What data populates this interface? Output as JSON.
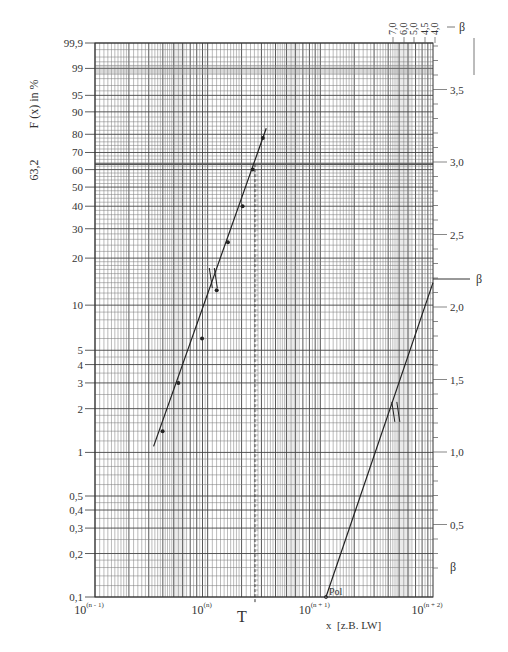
{
  "chart_data": {
    "type": "scatter",
    "xlabel": "x  [z.B. LW]",
    "ylabel": "F (x)  in %",
    "x_scale": "log",
    "y_scale": "weibull",
    "x_ticks": [
      {
        "base": "10",
        "exp": "(n - 1)"
      },
      {
        "base": "10",
        "exp": "(n)"
      },
      {
        "base": "10",
        "exp": "(n + 1)"
      },
      {
        "base": "10",
        "exp": "(n + 2)"
      }
    ],
    "y_ticks": [
      "99,9",
      "99",
      "95",
      "90",
      "80",
      "70",
      "60",
      "50",
      "40",
      "30",
      "20",
      "10",
      "5",
      "4",
      "3",
      "2",
      "1",
      "0,5",
      "0,4",
      "0,3",
      "0,2",
      "0,1"
    ],
    "y_tick_values": [
      99.9,
      99,
      95,
      90,
      80,
      70,
      60,
      50,
      40,
      30,
      20,
      10,
      5,
      4,
      3,
      2,
      1,
      0.5,
      0.4,
      0.3,
      0.2,
      0.1
    ],
    "characteristic_line_label": "63,2",
    "characteristic_line_value": 63.2,
    "T_label": "T",
    "T_x_decades": 1.42,
    "beta_right_ticks": [
      "3,5",
      "3,0",
      "2,5",
      "2,0",
      "1,5",
      "1,0",
      "0,5"
    ],
    "beta_right_values": [
      3.5,
      3.0,
      2.5,
      2.0,
      1.5,
      1.0,
      0.5
    ],
    "beta_top_ticks": [
      "7,0",
      "6,0",
      "5,0",
      "4,5",
      "4,0"
    ],
    "beta_label": "β",
    "beta_estimate": 2.2,
    "pole_label": "Pol",
    "series": [
      {
        "name": "Messpunkte",
        "points": [
          {
            "x_dec": 0.6,
            "F": 1.4
          },
          {
            "x_dec": 0.74,
            "F": 3.0
          },
          {
            "x_dec": 0.95,
            "F": 6.0
          },
          {
            "x_dec": 1.08,
            "F": 12.5
          },
          {
            "x_dec": 1.18,
            "F": 25.0
          },
          {
            "x_dec": 1.31,
            "F": 40.0
          },
          {
            "x_dec": 1.4,
            "F": 60.0
          },
          {
            "x_dec": 1.49,
            "F": 78.0
          }
        ]
      },
      {
        "name": "Ausgleichsgerade",
        "line": [
          {
            "x_dec": 0.52,
            "F": 1.1
          },
          {
            "x_dec": 1.52,
            "F": 83.0
          }
        ]
      },
      {
        "name": "Parallele durch Pol",
        "line": [
          {
            "x_dec": 2.05,
            "F": 0.1
          },
          {
            "x_dec": 3.0,
            "F": 14.0
          }
        ]
      }
    ],
    "legend": "none",
    "grid": true
  }
}
